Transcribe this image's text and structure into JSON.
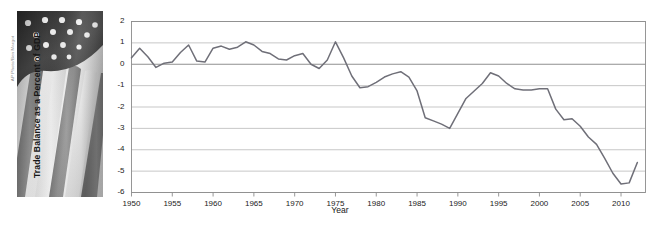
{
  "figure": {
    "photo_credit": "AP Photo/Ben Margot",
    "photo_alt": "american-flag-photo"
  },
  "chart_data": {
    "type": "line",
    "title": "",
    "xlabel": "Year",
    "ylabel": "Trade Balance as a Percent of GDP",
    "xlim": [
      1950,
      2013
    ],
    "ylim": [
      -6,
      2
    ],
    "ytick_labels": [
      "2",
      "1",
      "0",
      "-1",
      "-2",
      "-3",
      "-4",
      "-5",
      "-6"
    ],
    "yticks": [
      2,
      1,
      0,
      -1,
      -2,
      -3,
      -4,
      -5,
      -6
    ],
    "xtick_labels": [
      "1950",
      "1955",
      "1960",
      "1965",
      "1970",
      "1975",
      "1980",
      "1985",
      "1990",
      "1995",
      "2000",
      "2005",
      "2010"
    ],
    "xticks": [
      1950,
      1955,
      1960,
      1965,
      1970,
      1975,
      1980,
      1985,
      1990,
      1995,
      2000,
      2005,
      2010
    ],
    "grid": "horizontal",
    "legend": "none",
    "line_color": "#6f6f78",
    "grid_color": "#b9b9b9",
    "axis_color": "#8c8c8c",
    "x": [
      1950,
      1951,
      1952,
      1953,
      1954,
      1955,
      1956,
      1957,
      1958,
      1959,
      1960,
      1961,
      1962,
      1963,
      1964,
      1965,
      1966,
      1967,
      1968,
      1969,
      1970,
      1971,
      1972,
      1973,
      1974,
      1975,
      1976,
      1977,
      1978,
      1979,
      1980,
      1981,
      1982,
      1983,
      1984,
      1985,
      1986,
      1987,
      1988,
      1989,
      1990,
      1991,
      1992,
      1993,
      1994,
      1995,
      1996,
      1997,
      1998,
      1999,
      2000,
      2001,
      2002,
      2003,
      2004,
      2005,
      2006,
      2007,
      2008,
      2009,
      2010,
      2011,
      2012
    ],
    "values": [
      0.3,
      0.75,
      0.35,
      -0.15,
      0.05,
      0.1,
      0.55,
      0.9,
      0.15,
      0.1,
      0.75,
      0.85,
      0.7,
      0.8,
      1.05,
      0.9,
      0.6,
      0.5,
      0.25,
      0.2,
      0.4,
      0.5,
      0.0,
      -0.2,
      0.2,
      1.05,
      0.3,
      -0.55,
      -1.1,
      -1.05,
      -0.85,
      -0.6,
      -0.45,
      -0.35,
      -0.6,
      -1.25,
      -2.5,
      -2.65,
      -2.8,
      -3.0,
      -2.3,
      -1.6,
      -1.25,
      -0.9,
      -0.4,
      -0.55,
      -0.9,
      -1.15,
      -1.2,
      -1.2,
      -1.15,
      -1.15,
      -2.1,
      -2.6,
      -2.55,
      -2.9,
      -3.4,
      -3.75,
      -4.4,
      -5.1,
      -5.6,
      -5.55,
      -4.6
    ],
    "series": [
      {
        "name": "Trade Balance as a Percent of GDP",
        "values": [
          0.3,
          0.75,
          0.35,
          -0.15,
          0.05,
          0.1,
          0.55,
          0.9,
          0.15,
          0.1,
          0.75,
          0.85,
          0.7,
          0.8,
          1.05,
          0.9,
          0.6,
          0.5,
          0.25,
          0.2,
          0.4,
          0.5,
          0.0,
          -0.2,
          0.2,
          1.05,
          0.3,
          -0.55,
          -1.1,
          -1.05,
          -0.85,
          -0.6,
          -0.45,
          -0.35,
          -0.6,
          -1.25,
          -2.5,
          -2.65,
          -2.8,
          -3.0,
          -2.3,
          -1.6,
          -1.25,
          -0.9,
          -0.4,
          -0.55,
          -0.9,
          -1.15,
          -1.2,
          -1.2,
          -1.15,
          -1.15,
          -2.1,
          -2.6,
          -2.55,
          -2.9,
          -3.4,
          -3.75,
          -4.4,
          -5.1,
          -5.6,
          -5.55,
          -4.6
        ]
      }
    ],
    "series_points": [
      [
        1950,
        0.3
      ],
      [
        1951,
        0.75
      ],
      [
        1952,
        0.35
      ],
      [
        1953,
        -0.15
      ],
      [
        1954,
        0.05
      ],
      [
        1955,
        0.1
      ],
      [
        1956,
        0.55
      ],
      [
        1957,
        0.9
      ],
      [
        1958,
        0.15
      ],
      [
        1959,
        0.1
      ],
      [
        1960,
        0.75
      ],
      [
        1961,
        0.85
      ],
      [
        1962,
        0.7
      ],
      [
        1963,
        0.8
      ],
      [
        1964,
        1.05
      ],
      [
        1965,
        0.9
      ],
      [
        1966,
        0.6
      ],
      [
        1967,
        0.5
      ],
      [
        1968,
        0.25
      ],
      [
        1969,
        0.2
      ],
      [
        1970,
        0.4
      ],
      [
        1971,
        0.5
      ],
      [
        1972,
        0.0
      ],
      [
        1973,
        -0.2
      ],
      [
        1974,
        0.2
      ],
      [
        1975,
        1.05
      ],
      [
        1976,
        0.3
      ],
      [
        1977,
        -0.55
      ],
      [
        1978,
        -1.1
      ],
      [
        1979,
        -1.05
      ],
      [
        1980,
        -0.85
      ],
      [
        1981,
        -0.6
      ],
      [
        1982,
        -0.45
      ],
      [
        1983,
        -0.35
      ],
      [
        1984,
        -0.6
      ],
      [
        1985,
        -1.25
      ],
      [
        1986,
        -2.5
      ],
      [
        1987,
        -2.65
      ],
      [
        1988,
        -2.8
      ],
      [
        1989,
        -3.0
      ],
      [
        1990,
        -2.3
      ],
      [
        1991,
        -1.6
      ],
      [
        1992,
        -1.25
      ],
      [
        1993,
        -0.9
      ],
      [
        1994,
        -0.4
      ],
      [
        1995,
        -0.55
      ],
      [
        1996,
        -0.9
      ],
      [
        1997,
        -1.15
      ],
      [
        1998,
        -1.2
      ],
      [
        1999,
        -1.2
      ],
      [
        2000,
        -1.15
      ],
      [
        2001,
        -1.15
      ],
      [
        2002,
        -2.1
      ],
      [
        2003,
        -2.6
      ],
      [
        2004,
        -2.55
      ],
      [
        2005,
        -2.9
      ],
      [
        2006,
        -3.4
      ],
      [
        2007,
        -3.75
      ],
      [
        2008,
        -4.4
      ],
      [
        2009,
        -5.1
      ],
      [
        2010,
        -5.6
      ],
      [
        2011,
        -5.55
      ],
      [
        2012,
        -4.6
      ]
    ]
  }
}
